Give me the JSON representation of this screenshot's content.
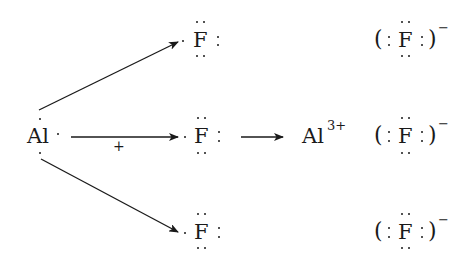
{
  "diagram": {
    "type": "lewis-dot-ionic-bond-formation",
    "reactant_metal": {
      "symbol": "Al",
      "valence_electrons": 3
    },
    "reactant_nonmetal": {
      "symbol": "F",
      "count": 3,
      "valence_electrons": 7
    },
    "electron_transfer_label": "+",
    "product_cation": {
      "symbol": "Al",
      "charge": "3+"
    },
    "product_anion": {
      "symbol": "F",
      "open_bracket": "(",
      "close_bracket": ")",
      "charge": "−",
      "count": 3,
      "lone_pair_glyph": ":"
    },
    "colors": {
      "ink": "#1a1a1a",
      "background": "#ffffff"
    }
  }
}
